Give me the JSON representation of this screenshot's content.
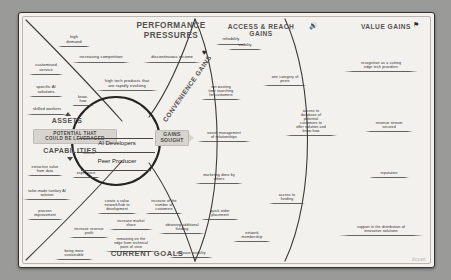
{
  "canvas": {
    "watermark": "dcsan"
  },
  "headings": {
    "performance_pressures": "PERFORMANCE\nPRESSURES",
    "access_reach_gains": "ACCESS & REACH GAINS",
    "value_gains": "VALUE GAINS",
    "convenience_gains": "CONVENIENCE GAINS",
    "gains_sought": "GAINS\nSOUGHT",
    "assets": "ASSETS",
    "potential": "POTENTIAL THAT\nCOULD BE LEVERAGED",
    "capabilities": "CAPABILITIES",
    "current_goals": "CURRENT GOALS"
  },
  "icons": {
    "heart": "heart-icon",
    "megaphone": "megaphone-icon",
    "flag": "flag-icon",
    "up_arrow_assets": "up-arrow-icon",
    "down_arrow_capabilities": "down-arrow-icon"
  },
  "center": {
    "persona_primary": "AI Developers",
    "persona_secondary": "Peer Producer"
  },
  "notes": {
    "performance": [
      {
        "text": "high\ndemand"
      },
      {
        "text": "reliability"
      },
      {
        "text": "increasing competition"
      },
      {
        "text": "discontinuous income"
      },
      {
        "text": "high tech products that\nare rapidly evolving"
      }
    ],
    "assets": [
      {
        "text": "customised\nservice"
      },
      {
        "text": "specific AI\nsolutions"
      },
      {
        "text": "skilled workers"
      },
      {
        "text": "know-\nhow"
      }
    ],
    "capabilities": [
      {
        "text": "extractive value\nfrom data"
      },
      {
        "text": "experience"
      },
      {
        "text": "tailor-made turnkey AI\nsolution"
      },
      {
        "text": "process\nimprovement"
      }
    ],
    "current_goals": [
      {
        "text": "create a value\nnetwork/hub to\ndevelopment"
      },
      {
        "text": "increase of the\nnumber of\ncustomers"
      },
      {
        "text": "increase market\nshare"
      },
      {
        "text": "obtaining additional\nfunding"
      },
      {
        "text": "increase revenue\nprofit"
      },
      {
        "text": "remaining on the\nedge from technical\npoint of view"
      },
      {
        "text": "being more\nsustainable"
      },
      {
        "text": "increase visibility"
      }
    ],
    "convenience_gains": [
      {
        "text": "not wasting\ntime searching\nfor customers"
      },
      {
        "text": "easier management\nof relationships"
      },
      {
        "text": "marketing done by\nothers"
      },
      {
        "text": "quick order\nplacement"
      }
    ],
    "access_reach_gains": [
      {
        "text": "visibility"
      },
      {
        "text": "one category of\npeers"
      },
      {
        "text": "access to\ndatabase of\npotential\ncustomers to\noffer solution and\nknow-how"
      },
      {
        "text": "access to\nfunding"
      },
      {
        "text": "network\nmembership"
      }
    ],
    "value_gains": [
      {
        "text": "recognition as a cutting\nedge tech providers"
      },
      {
        "text": "revenue stream\nsecured"
      },
      {
        "text": "reputation"
      },
      {
        "text": "support in the distribution of\ninnovative solutions"
      }
    ]
  }
}
